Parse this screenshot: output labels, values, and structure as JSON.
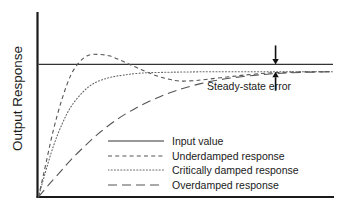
{
  "chart_data": {
    "type": "line",
    "title": "",
    "xlabel": "",
    "ylabel": "Output Response",
    "xlim": [
      0,
      1
    ],
    "ylim": [
      0,
      1.32
    ],
    "grid": false,
    "legend_position": "inside-bottom-center",
    "annotations": [
      {
        "name": "steady-state-error",
        "label": "Steady-state error",
        "type": "double-arrow-vertical",
        "x": 0.805,
        "y_top": 1.0,
        "y_bottom": 0.945
      }
    ],
    "series": [
      {
        "name": "Input value",
        "style": "solid",
        "color": "#333333",
        "steady_state": 1.0,
        "x": [
          0,
          1
        ],
        "values": [
          1.0,
          1.0
        ]
      },
      {
        "name": "Underdamped response",
        "style": "dashed",
        "color": "#555555",
        "steady_state": 0.945,
        "overshoot_peak": 1.075,
        "peak_x": 0.205,
        "undershoot_trough": 0.875,
        "trough_x": 0.48,
        "x": [
          0.0,
          0.02,
          0.05,
          0.08,
          0.11,
          0.14,
          0.17,
          0.205,
          0.24,
          0.28,
          0.32,
          0.36,
          0.4,
          0.44,
          0.48,
          0.53,
          0.58,
          0.64,
          0.7,
          0.78,
          0.86,
          0.94,
          1.0
        ],
        "values": [
          0.0,
          0.2,
          0.5,
          0.74,
          0.92,
          1.02,
          1.07,
          1.075,
          1.065,
          1.03,
          0.99,
          0.95,
          0.915,
          0.89,
          0.875,
          0.878,
          0.89,
          0.905,
          0.92,
          0.935,
          0.942,
          0.945,
          0.945
        ]
      },
      {
        "name": "Critically damped response",
        "style": "dotted",
        "color": "#666666",
        "steady_state": 0.945,
        "x": [
          0.0,
          0.02,
          0.05,
          0.08,
          0.11,
          0.15,
          0.19,
          0.24,
          0.29,
          0.35,
          0.42,
          0.5,
          0.6,
          0.72,
          0.85,
          1.0
        ],
        "values": [
          0.0,
          0.16,
          0.38,
          0.55,
          0.68,
          0.79,
          0.86,
          0.9,
          0.92,
          0.935,
          0.94,
          0.943,
          0.945,
          0.945,
          0.945,
          0.945
        ]
      },
      {
        "name": "Overdamped response",
        "style": "long-dashed",
        "color": "#555555",
        "steady_state": 0.945,
        "x": [
          0.0,
          0.03,
          0.07,
          0.11,
          0.16,
          0.21,
          0.27,
          0.33,
          0.4,
          0.47,
          0.55,
          0.63,
          0.72,
          0.81,
          0.9,
          1.0
        ],
        "values": [
          0.0,
          0.08,
          0.18,
          0.28,
          0.39,
          0.49,
          0.59,
          0.67,
          0.745,
          0.805,
          0.855,
          0.89,
          0.915,
          0.932,
          0.94,
          0.945
        ]
      }
    ]
  },
  "axes": {
    "y_axis_name": "y-axis-line",
    "x_axis_name": "x-axis-line"
  },
  "legend": {
    "entries": [
      {
        "label": "Input value",
        "style": "solid"
      },
      {
        "label": "Underdamped response",
        "style": "dashed"
      },
      {
        "label": "Critically damped response",
        "style": "dotted"
      },
      {
        "label": "Overdamped response",
        "style": "long-dashed"
      }
    ]
  }
}
